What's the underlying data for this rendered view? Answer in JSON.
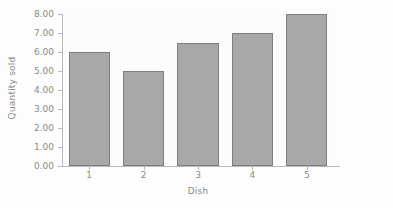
{
  "chart_data": {
    "type": "bar",
    "title": "",
    "subtitle": "",
    "xlabel": "Dish",
    "ylabel": "Quantity sold",
    "categories": [
      "1",
      "2",
      "3",
      "4",
      "5"
    ],
    "values": [
      6.0,
      5.0,
      6.5,
      7.0,
      8.0
    ],
    "ylim": [
      0,
      8
    ],
    "ytick_values": [
      0,
      1,
      2,
      3,
      4,
      5,
      6,
      7,
      8
    ],
    "ytick_labels": [
      "0.00",
      "1.00",
      "2.00",
      "3.00",
      "4.00",
      "5.00",
      "6.00",
      "7.00",
      "8.00"
    ],
    "xtick_labels": [
      "1",
      "2",
      "3",
      "4",
      "5"
    ],
    "grid": false,
    "legend": null,
    "legend_position": "none",
    "annotations": [],
    "colors": {
      "bar_fill": "#a8a8a8",
      "bar_border": "#7f7f7f",
      "axis_line": "#b9b9b9",
      "text": "#8a8a8a",
      "plot_background": "#fcfcfc",
      "figure_background": "#fdfdfd"
    }
  }
}
